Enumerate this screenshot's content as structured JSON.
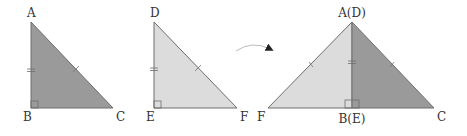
{
  "colors": {
    "dark_fill": "#9a9a9a",
    "light_fill": "#dcdcdc",
    "stroke": "#6e6e6e",
    "arrow": "#222222"
  },
  "triangles": [
    {
      "name": "triangle-abc",
      "shade": "dark",
      "vertices": {
        "top": "A",
        "bottom_left": "B",
        "bottom_right": "C"
      }
    },
    {
      "name": "triangle-def",
      "shade": "light",
      "vertices": {
        "top": "D",
        "bottom_left": "E",
        "bottom_right": "F"
      }
    }
  ],
  "combined": {
    "top": "A(D)",
    "bottom_mid": "B(E)",
    "left": "F",
    "right": "C"
  },
  "marks": {
    "leg_tick": "double",
    "hypotenuse_tick": "single",
    "right_angle": true
  },
  "arrow": {
    "direction": "right",
    "meaning": "flip/reflect"
  }
}
